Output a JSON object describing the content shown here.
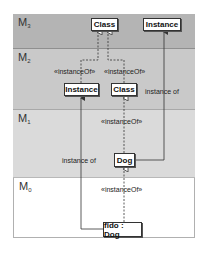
{
  "layers": [
    {
      "id": "M3",
      "base": "M",
      "sub": "3"
    },
    {
      "id": "M2",
      "base": "M",
      "sub": "2"
    },
    {
      "id": "M1",
      "base": "M",
      "sub": "1"
    },
    {
      "id": "M0",
      "base": "M",
      "sub": "0"
    }
  ],
  "nodes": {
    "m3_class": "Class",
    "m3_instance": "Instance",
    "m2_instance": "Instance",
    "m2_class": "Class",
    "m1_dog": "Dog",
    "m0_fido": "fido : Dog"
  },
  "labels": {
    "m2_instanceof_left": "«instanceOf»",
    "m2_instanceof_right": "«instanceOf»",
    "m2_instance_of": "instance of",
    "m1_instanceof": "«instanceOf»",
    "m1_instance_of": "instance of",
    "m0_instanceof": "«instanceOf»"
  },
  "colors": {
    "m3_band": "#b4b4b4",
    "m2_band": "#c9c9c9",
    "m1_band": "#dadada",
    "m0_band": "#ffffff",
    "line": "#333333"
  }
}
